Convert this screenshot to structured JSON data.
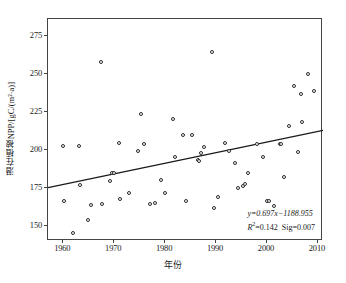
{
  "chart_data": {
    "type": "scatter",
    "title": "",
    "xlabel": "年份",
    "ylabel": "潜在植被NPP/[gC/(m²·a)]",
    "xlim": [
      1957,
      2011
    ],
    "ylim": [
      140,
      286
    ],
    "xticks": [
      1960,
      1970,
      1980,
      1990,
      2000,
      2010
    ],
    "yticks": [
      150,
      175,
      200,
      225,
      250,
      275
    ],
    "grid": false,
    "legend": false,
    "annotations": [
      "y=0.697x−1188.955",
      "R²=0.142  Sig=0.007"
    ],
    "regression": {
      "slope": 0.697,
      "intercept": -1188.955,
      "r_squared": 0.142,
      "significance": 0.007,
      "x_start": 1957,
      "x_end": 2011
    },
    "points": [
      {
        "x": 1960.0,
        "y": 202.5
      },
      {
        "x": 1960.2,
        "y": 166.5
      },
      {
        "x": 1962.0,
        "y": 145.5
      },
      {
        "x": 1963.0,
        "y": 202.5
      },
      {
        "x": 1963.2,
        "y": 177.0
      },
      {
        "x": 1964.8,
        "y": 153.5
      },
      {
        "x": 1965.5,
        "y": 164.0
      },
      {
        "x": 1967.4,
        "y": 258.0
      },
      {
        "x": 1967.6,
        "y": 164.5
      },
      {
        "x": 1969.2,
        "y": 179.5
      },
      {
        "x": 1969.6,
        "y": 184.5
      },
      {
        "x": 1969.9,
        "y": 185.0
      },
      {
        "x": 1971.0,
        "y": 204.5
      },
      {
        "x": 1971.2,
        "y": 167.5
      },
      {
        "x": 1973.0,
        "y": 171.5
      },
      {
        "x": 1974.6,
        "y": 199.5
      },
      {
        "x": 1975.3,
        "y": 223.5
      },
      {
        "x": 1975.8,
        "y": 204.0
      },
      {
        "x": 1977.0,
        "y": 164.5
      },
      {
        "x": 1978.0,
        "y": 165.0
      },
      {
        "x": 1979.2,
        "y": 180.0
      },
      {
        "x": 1980.0,
        "y": 171.5
      },
      {
        "x": 1981.5,
        "y": 220.5
      },
      {
        "x": 1982.0,
        "y": 195.5
      },
      {
        "x": 1983.5,
        "y": 209.5
      },
      {
        "x": 1984.0,
        "y": 166.0
      },
      {
        "x": 1985.3,
        "y": 209.5
      },
      {
        "x": 1986.4,
        "y": 193.0
      },
      {
        "x": 1986.6,
        "y": 192.5
      },
      {
        "x": 1987.0,
        "y": 198.0
      },
      {
        "x": 1987.6,
        "y": 202.0
      },
      {
        "x": 1989.2,
        "y": 264.5
      },
      {
        "x": 1989.6,
        "y": 161.5
      },
      {
        "x": 1990.3,
        "y": 169.0
      },
      {
        "x": 1991.8,
        "y": 204.5
      },
      {
        "x": 1992.5,
        "y": 199.5
      },
      {
        "x": 1993.8,
        "y": 191.0
      },
      {
        "x": 1994.4,
        "y": 175.0
      },
      {
        "x": 1995.2,
        "y": 176.5
      },
      {
        "x": 1995.6,
        "y": 177.5
      },
      {
        "x": 1996.3,
        "y": 185.0
      },
      {
        "x": 1998.0,
        "y": 203.5
      },
      {
        "x": 1999.3,
        "y": 195.0
      },
      {
        "x": 2000.0,
        "y": 166.5
      },
      {
        "x": 2000.4,
        "y": 166.0
      },
      {
        "x": 2001.3,
        "y": 163.0
      },
      {
        "x": 2002.5,
        "y": 204.0
      },
      {
        "x": 2002.8,
        "y": 203.5
      },
      {
        "x": 2003.3,
        "y": 182.0
      },
      {
        "x": 2004.3,
        "y": 215.5
      },
      {
        "x": 2005.4,
        "y": 242.0
      },
      {
        "x": 2006.0,
        "y": 198.5
      },
      {
        "x": 2006.6,
        "y": 237.0
      },
      {
        "x": 2006.8,
        "y": 218.0
      },
      {
        "x": 2008.0,
        "y": 250.0
      },
      {
        "x": 2009.2,
        "y": 238.5
      }
    ]
  }
}
